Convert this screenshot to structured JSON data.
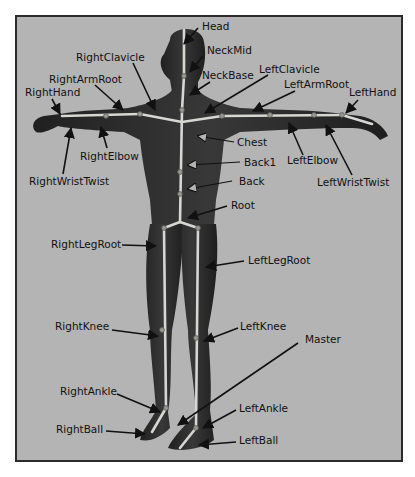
{
  "figure": {
    "frame": {
      "x": 16,
      "y": 16,
      "w": 386,
      "h": 445
    },
    "colors": {
      "background": "#b4b4b4",
      "frame_border": "#2b2b2b",
      "body": "#2a2a2a",
      "bone": "#d6d6d2",
      "label": "#111111"
    }
  },
  "labels": [
    {
      "id": "head",
      "text": "Head",
      "x": 202,
      "y": 30,
      "anchor": "start",
      "ax": 198,
      "ay": 28,
      "tx": 184,
      "ty": 44,
      "open": false
    },
    {
      "id": "neck-mid",
      "text": "NeckMid",
      "x": 207,
      "y": 54,
      "anchor": "start",
      "ax": 203,
      "ay": 56,
      "tx": 190,
      "ty": 72,
      "open": false
    },
    {
      "id": "neck-base",
      "text": "NeckBase",
      "x": 202,
      "y": 79,
      "anchor": "start",
      "ax": 210,
      "ay": 82,
      "tx": 190,
      "ty": 95,
      "open": false
    },
    {
      "id": "right-clavicle",
      "text": "RightClavicle",
      "x": 76,
      "y": 61,
      "anchor": "start",
      "ax": 133,
      "ay": 63,
      "tx": 155,
      "ty": 110,
      "open": false
    },
    {
      "id": "left-clavicle",
      "text": "LeftClavicle",
      "x": 259,
      "y": 73,
      "anchor": "start",
      "ax": 268,
      "ay": 75,
      "tx": 205,
      "ty": 113,
      "open": false
    },
    {
      "id": "right-arm-root",
      "text": "RightArmRoot",
      "x": 49,
      "y": 83,
      "anchor": "start",
      "ax": 95,
      "ay": 85,
      "tx": 123,
      "ty": 110,
      "open": false
    },
    {
      "id": "left-arm-root",
      "text": "LeftArmRoot",
      "x": 284,
      "y": 88,
      "anchor": "start",
      "ax": 295,
      "ay": 91,
      "tx": 253,
      "ty": 111,
      "open": false
    },
    {
      "id": "right-hand",
      "text": "RightHand",
      "x": 25,
      "y": 96,
      "anchor": "start",
      "ax": 52,
      "ay": 99,
      "tx": 60,
      "ty": 114,
      "open": false
    },
    {
      "id": "left-hand",
      "text": "LeftHand",
      "x": 349,
      "y": 96,
      "anchor": "start",
      "ax": 358,
      "ay": 100,
      "tx": 346,
      "ty": 113,
      "open": false
    },
    {
      "id": "chest",
      "text": "Chest",
      "x": 237,
      "y": 146,
      "anchor": "start",
      "ax": 234,
      "ay": 142,
      "tx": 198,
      "ty": 136,
      "open": true
    },
    {
      "id": "right-elbow",
      "text": "RightElbow",
      "x": 80,
      "y": 160,
      "anchor": "start",
      "ax": 107,
      "ay": 148,
      "tx": 101,
      "ty": 127,
      "open": false
    },
    {
      "id": "left-elbow",
      "text": "LeftElbow",
      "x": 287,
      "y": 164,
      "anchor": "start",
      "ax": 303,
      "ay": 155,
      "tx": 289,
      "ty": 123,
      "open": false
    },
    {
      "id": "back1",
      "text": "Back1",
      "x": 244,
      "y": 166,
      "anchor": "start",
      "ax": 240,
      "ay": 162,
      "tx": 188,
      "ty": 165,
      "open": true
    },
    {
      "id": "right-wrist-twist",
      "text": "RightWristTwist",
      "x": 29,
      "y": 185,
      "anchor": "start",
      "ax": 63,
      "ay": 174,
      "tx": 71,
      "ty": 128,
      "open": false
    },
    {
      "id": "left-wrist-twist",
      "text": "LeftWristTwist",
      "x": 317,
      "y": 186,
      "anchor": "start",
      "ax": 352,
      "ay": 175,
      "tx": 326,
      "ty": 125,
      "open": false
    },
    {
      "id": "back",
      "text": "Back",
      "x": 239,
      "y": 185,
      "anchor": "start",
      "ax": 232,
      "ay": 181,
      "tx": 188,
      "ty": 189,
      "open": true
    },
    {
      "id": "root",
      "text": "Root",
      "x": 231,
      "y": 209,
      "anchor": "start",
      "ax": 227,
      "ay": 206,
      "tx": 188,
      "ty": 218,
      "open": false
    },
    {
      "id": "right-leg-root",
      "text": "RightLegRoot",
      "x": 51,
      "y": 248,
      "anchor": "start",
      "ax": 122,
      "ay": 245,
      "tx": 156,
      "ty": 246,
      "open": false
    },
    {
      "id": "left-leg-root",
      "text": "LeftLegRoot",
      "x": 248,
      "y": 264,
      "anchor": "start",
      "ax": 244,
      "ay": 261,
      "tx": 206,
      "ty": 267,
      "open": false
    },
    {
      "id": "right-knee",
      "text": "RightKnee",
      "x": 55,
      "y": 330,
      "anchor": "start",
      "ax": 112,
      "ay": 330,
      "tx": 158,
      "ty": 336,
      "open": false
    },
    {
      "id": "left-knee",
      "text": "LeftKnee",
      "x": 240,
      "y": 330,
      "anchor": "start",
      "ax": 238,
      "ay": 328,
      "tx": 204,
      "ty": 341,
      "open": false
    },
    {
      "id": "master",
      "text": "Master",
      "x": 305,
      "y": 343,
      "anchor": "start",
      "ax": 298,
      "ay": 343,
      "tx": 178,
      "ty": 425,
      "open": false
    },
    {
      "id": "right-ankle",
      "text": "RightAnkle",
      "x": 60,
      "y": 395,
      "anchor": "start",
      "ax": 117,
      "ay": 394,
      "tx": 160,
      "ty": 412,
      "open": false
    },
    {
      "id": "left-ankle",
      "text": "LeftAnkle",
      "x": 239,
      "y": 412,
      "anchor": "start",
      "ax": 236,
      "ay": 410,
      "tx": 203,
      "ty": 428,
      "open": false
    },
    {
      "id": "right-ball",
      "text": "RightBall",
      "x": 56,
      "y": 433,
      "anchor": "start",
      "ax": 106,
      "ay": 431,
      "tx": 145,
      "ty": 434,
      "open": false
    },
    {
      "id": "left-ball",
      "text": "LeftBall",
      "x": 239,
      "y": 444,
      "anchor": "start",
      "ax": 236,
      "ay": 442,
      "tx": 199,
      "ty": 445,
      "open": false
    }
  ]
}
